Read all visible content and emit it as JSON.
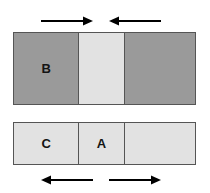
{
  "figure": {
    "name": "block-friction-force-diagram",
    "background_color": "#ffffff",
    "colors": {
      "dark_block": "#9a9a9a",
      "light_block": "#e2e2e2",
      "outline": "#555555",
      "label_text": "#141414",
      "arrow": "#000000"
    },
    "top_bar": {
      "name": "upper-block-row",
      "segments": [
        {
          "label": "B",
          "shade": "dark"
        },
        {
          "label": "",
          "shade": "light"
        },
        {
          "label": "",
          "shade": "dark"
        }
      ]
    },
    "bottom_bar": {
      "name": "lower-block-row",
      "segments": [
        {
          "label": "C",
          "shade": "light"
        },
        {
          "label": "A",
          "shade": "light"
        },
        {
          "label": "",
          "shade": "light"
        }
      ]
    },
    "arrows": [
      {
        "name": "arrow-top-left",
        "direction": "right",
        "position": "above-left"
      },
      {
        "name": "arrow-top-right",
        "direction": "left",
        "position": "above-right"
      },
      {
        "name": "arrow-bottom-left",
        "direction": "left",
        "position": "below-left"
      },
      {
        "name": "arrow-bottom-right",
        "direction": "right",
        "position": "below-right"
      }
    ]
  }
}
